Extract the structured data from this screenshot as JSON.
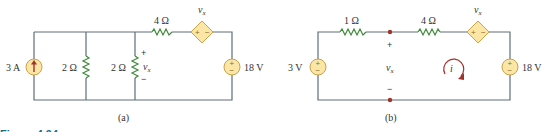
{
  "figure": {
    "caption": "Figure 4.94",
    "colors": {
      "wire": "#5e6f7a",
      "resistor": "#3f8a3a",
      "source_fill": "#fbe6a6",
      "source_stroke": "#c9a24a",
      "node": "#a0322b",
      "caption": "#1f6d8a"
    }
  },
  "circuit_a": {
    "label": "(a)",
    "current_source": {
      "value": "3 A",
      "icon": "current-source-up-arrow"
    },
    "resistor_1": {
      "value": "2 Ω"
    },
    "resistor_2": {
      "value": "2 Ω",
      "voltage_label": "v",
      "voltage_sub": "x",
      "plus": "+",
      "minus": "−"
    },
    "resistor_3": {
      "value": "4 Ω"
    },
    "dependent_source": {
      "label": "v",
      "label_sub": "x",
      "plus": "+",
      "minus": "−"
    },
    "voltage_source": {
      "value": "18 V",
      "plus": "+",
      "minus": "−"
    }
  },
  "circuit_b": {
    "label": "(b)",
    "voltage_source_left": {
      "value": "3 V",
      "plus": "+",
      "minus": "−"
    },
    "resistor_1": {
      "value": "1 Ω"
    },
    "resistor_2": {
      "value": "4 Ω"
    },
    "open_terminals": {
      "voltage_label": "v",
      "voltage_sub": "x",
      "plus": "+",
      "minus": "−"
    },
    "dependent_source": {
      "label": "v",
      "label_sub": "x",
      "plus": "+",
      "minus": "−"
    },
    "loop_current": {
      "label": "i",
      "direction": "clockwise"
    },
    "voltage_source_right": {
      "value": "18 V",
      "plus": "+",
      "minus": "−"
    }
  }
}
